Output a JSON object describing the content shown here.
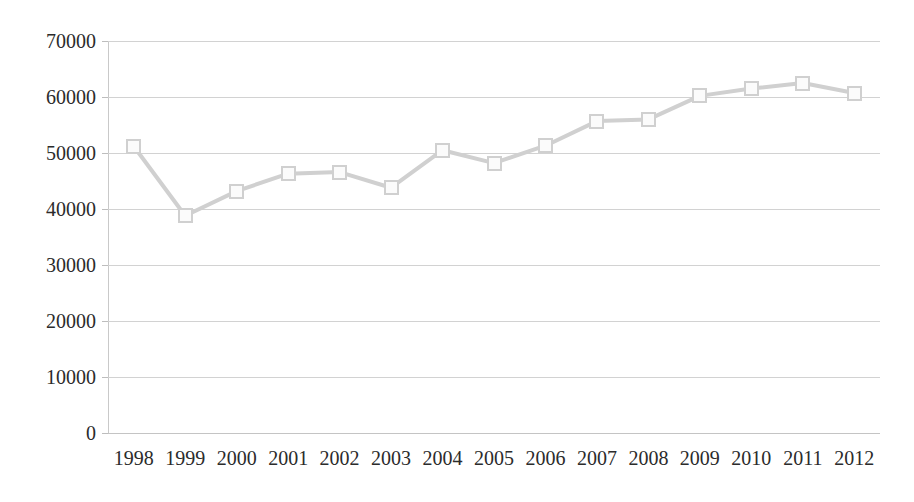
{
  "chart_data": {
    "type": "line",
    "title": "",
    "subtitle": "",
    "xlabel": "",
    "ylabel": "",
    "categories": [
      "1998",
      "1999",
      "2000",
      "2001",
      "2002",
      "2003",
      "2004",
      "2005",
      "2006",
      "2007",
      "2008",
      "2009",
      "2010",
      "2011",
      "2012"
    ],
    "values": [
      51200,
      38800,
      43200,
      46300,
      46600,
      43800,
      50500,
      48200,
      51300,
      55700,
      56000,
      60200,
      61500,
      62500,
      60700
    ],
    "series": [
      {
        "name": "",
        "values": [
          51200,
          38800,
          43200,
          46300,
          46600,
          43800,
          50500,
          48200,
          51300,
          55700,
          56000,
          60200,
          61500,
          62500,
          60700
        ]
      }
    ],
    "ylim": [
      0,
      70000
    ],
    "y_ticks": [
      0,
      10000,
      20000,
      30000,
      40000,
      50000,
      60000,
      70000
    ],
    "y_tick_labels": [
      "0",
      "10000",
      "20000",
      "30000",
      "40000",
      "50000",
      "60000",
      "70000"
    ],
    "x_tick_labels": [
      "1998",
      "1999",
      "2000",
      "2001",
      "2002",
      "2003",
      "2004",
      "2005",
      "2006",
      "2007",
      "2008",
      "2009",
      "2010",
      "2011",
      "2012"
    ],
    "grid": true,
    "grid_axis": "y",
    "legend": false,
    "legend_position": "none",
    "marker": "square",
    "line_color": "#d0d0d0",
    "marker_fill": "#fbfbfb",
    "marker_edge_color": "#d0d0d0",
    "grid_color": "#d2d2d2",
    "axis_color": "#c9c9c9",
    "text_color": "#2b2b2b",
    "background": "#ffffff"
  }
}
